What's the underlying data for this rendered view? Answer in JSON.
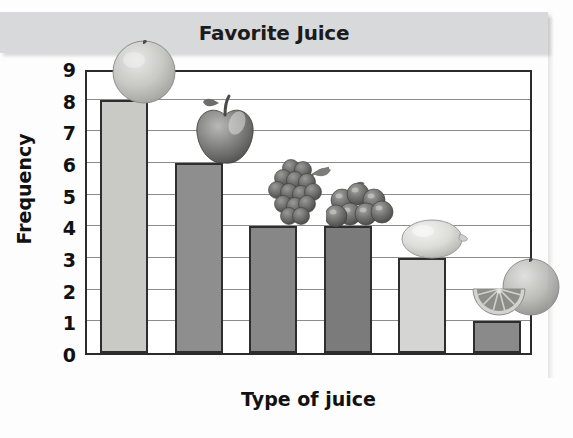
{
  "chart_data": {
    "type": "bar",
    "title": "Favorite Juice",
    "xlabel": "Type of juice",
    "ylabel": "Frequency",
    "categories": [
      "orange",
      "apple",
      "grape",
      "berry",
      "lemon",
      "grapefruit"
    ],
    "values": [
      8,
      6,
      4,
      4,
      3,
      1
    ],
    "ylim": [
      0,
      9
    ],
    "yticks": [
      "0",
      "1",
      "2",
      "3",
      "4",
      "5",
      "6",
      "7",
      "8",
      "9"
    ],
    "grid": true,
    "legend": "none",
    "bars": [
      {
        "category": "orange",
        "value": 8,
        "fill": "#c9c9c6",
        "icon": "orange-fruit-icon"
      },
      {
        "category": "apple",
        "value": 6,
        "fill": "#8e8e8e",
        "icon": "apple-fruit-icon"
      },
      {
        "category": "grape",
        "value": 4,
        "fill": "#878787",
        "icon": "grape-bunch-icon"
      },
      {
        "category": "berry",
        "value": 4,
        "fill": "#7b7b7b",
        "icon": "berry-cluster-icon"
      },
      {
        "category": "lemon",
        "value": 3,
        "fill": "#d5d5d3",
        "icon": "lemon-fruit-icon"
      },
      {
        "category": "grapefruit",
        "value": 1,
        "fill": "#8a8a8a",
        "icon": "grapefruit-half-icon"
      }
    ]
  },
  "colors": {
    "title_band": "#d8d9da",
    "frame": "#2b2b2b",
    "gridline": "#8c8c8c",
    "text": "#111111"
  }
}
